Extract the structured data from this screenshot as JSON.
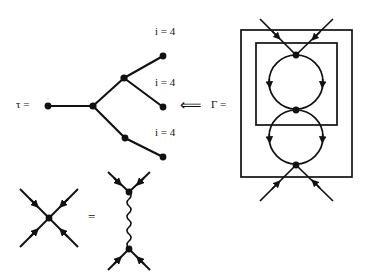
{
  "figure": {
    "type": "physics-feynman-diagram-figure",
    "background": "#ffffff",
    "ink_color": "#111111",
    "width": 366,
    "height": 278,
    "labels": {
      "tree_symbol": "τ =",
      "tree_symbol_name": "tau",
      "implies_arrow": "⟸",
      "graph_symbol": "Γ =",
      "graph_symbol_name": "Gamma",
      "leaf_label": "i = 4",
      "equals_sign": "="
    },
    "tree": {
      "name": "rooted-tree-tau",
      "root": {
        "x": 48,
        "y": 106
      },
      "branch_node": {
        "x": 93,
        "y": 106
      },
      "upper_node": {
        "x": 124,
        "y": 78
      },
      "lower_node": {
        "x": 125,
        "y": 138
      },
      "leaves": [
        {
          "x": 163,
          "y": 56,
          "label": "i = 4",
          "label_x": 155,
          "label_y": 34
        },
        {
          "x": 163,
          "y": 107,
          "label": "i = 4",
          "label_x": 155,
          "label_y": 85
        },
        {
          "x": 163,
          "y": 157,
          "label": "i = 4",
          "label_x": 155,
          "label_y": 135
        }
      ],
      "edges": [
        [
          48,
          106,
          93,
          106
        ],
        [
          93,
          106,
          124,
          78
        ],
        [
          124,
          78,
          163,
          56
        ],
        [
          124,
          78,
          163,
          107
        ],
        [
          93,
          106,
          125,
          138
        ],
        [
          125,
          138,
          163,
          157
        ]
      ]
    },
    "arrow": {
      "name": "implication-arrow",
      "x": 190,
      "y": 106,
      "glyph": "⟸"
    },
    "graph": {
      "name": "two-loop-diagram-gamma",
      "outer_box": {
        "x": 241,
        "y": 30,
        "w": 111,
        "h": 147
      },
      "inner_box": {
        "x": 256,
        "y": 43,
        "w": 81,
        "h": 82
      },
      "vertices": [
        {
          "x": 296,
          "y": 55,
          "name": "top-vertex"
        },
        {
          "x": 296,
          "y": 110,
          "name": "middle-vertex"
        },
        {
          "x": 296,
          "y": 165,
          "name": "bottom-vertex"
        }
      ],
      "loops": [
        {
          "cx": 296,
          "cy": 82,
          "r": 27,
          "name": "upper-loop"
        },
        {
          "cx": 296,
          "cy": 137,
          "r": 27,
          "name": "lower-loop"
        }
      ],
      "external_legs": [
        {
          "from": [
            262,
            20
          ],
          "to": [
            296,
            55
          ],
          "name": "incoming-leg-top-left"
        },
        {
          "from": [
            331,
            20
          ],
          "to": [
            296,
            55
          ],
          "name": "incoming-leg-top-right"
        },
        {
          "from": [
            262,
            200
          ],
          "to": [
            296,
            165
          ],
          "name": "incoming-leg-bottom-left"
        },
        {
          "from": [
            331,
            200
          ],
          "to": [
            296,
            165
          ],
          "name": "incoming-leg-bottom-right"
        }
      ]
    },
    "vertex_identity": {
      "name": "four-point-vertex-identity",
      "lhs": {
        "name": "contact-vertex",
        "center": {
          "x": 49,
          "y": 218
        },
        "legs": [
          {
            "from": [
              20,
              190
            ],
            "to": [
              49,
              218
            ]
          },
          {
            "from": [
              78,
              190
            ],
            "to": [
              49,
              218
            ]
          },
          {
            "from": [
              20,
              246
            ],
            "to": [
              49,
              218
            ]
          },
          {
            "from": [
              78,
              246
            ],
            "to": [
              49,
              218
            ]
          }
        ]
      },
      "equals": {
        "x": 92,
        "y": 218,
        "glyph": "="
      },
      "rhs": {
        "name": "boson-exchange-diagram",
        "top_vertex": {
          "x": 129,
          "y": 192
        },
        "bottom_vertex": {
          "x": 129,
          "y": 249
        },
        "propagator": {
          "name": "wavy-boson-propagator",
          "x": 129,
          "y1": 192,
          "y2": 249,
          "amplitude": 3.2,
          "wavelength": 7
        },
        "legs": [
          {
            "from": [
              108,
              172
            ],
            "to": [
              129,
              192
            ]
          },
          {
            "from": [
              150,
              172
            ],
            "to": [
              129,
              192
            ]
          },
          {
            "from": [
              108,
              270
            ],
            "to": [
              129,
              249
            ]
          },
          {
            "from": [
              150,
              270
            ],
            "to": [
              129,
              249
            ]
          }
        ]
      }
    }
  }
}
